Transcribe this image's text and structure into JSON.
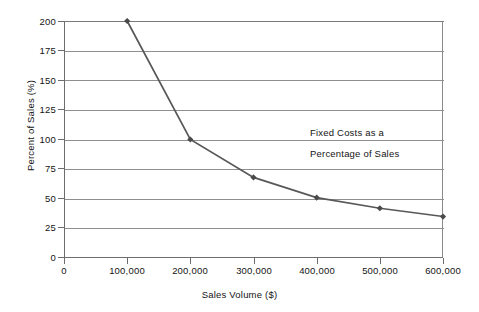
{
  "chart_data": {
    "type": "line",
    "title": "",
    "annotation": [
      "Fixed Costs as a",
      "Percentage of Sales"
    ],
    "xlabel": "Sales Volume ($)",
    "ylabel": "Percent of Sales (%)",
    "x": [
      100000,
      200000,
      300000,
      400000,
      500000,
      600000
    ],
    "values": [
      200,
      100,
      68,
      51,
      42,
      35
    ],
    "series": [
      {
        "name": "Fixed Costs as a Percentage of Sales",
        "values": [
          200,
          100,
          68,
          51,
          42,
          35
        ]
      }
    ],
    "xlim": [
      0,
      600000
    ],
    "ylim": [
      0,
      200
    ],
    "xticks": [
      0,
      100000,
      200000,
      300000,
      400000,
      500000,
      600000
    ],
    "xticklabels": [
      "0",
      "100,000",
      "200,000",
      "300,000",
      "400,000",
      "500,000",
      "600,000"
    ],
    "yticks": [
      0,
      25,
      50,
      75,
      100,
      125,
      150,
      175,
      200
    ],
    "yticklabels": [
      "0",
      "25",
      "50",
      "75",
      "100",
      "125",
      "150",
      "175",
      "200"
    ],
    "grid": "horizontal",
    "legend": "none",
    "colors": {
      "line": "#585858",
      "marker": "#4a4a4a",
      "grid": "#8f8f8f",
      "axis": "#6d6d6d",
      "text": "#141414",
      "background": "#ffffff"
    },
    "marker_shape": "diamond"
  }
}
